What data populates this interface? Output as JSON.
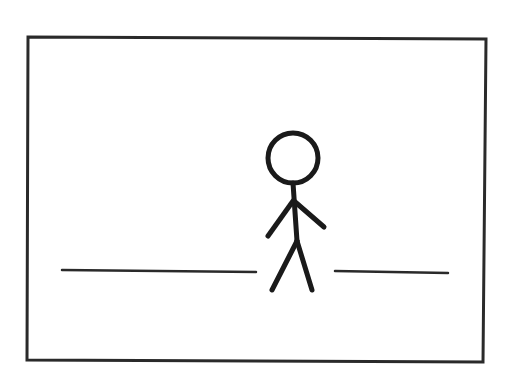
{
  "drawing": {
    "description": "Hand-drawn stick figure standing in a gap between two horizontal ground lines, inside a rectangular frame",
    "stroke_color": "#1a1a1a",
    "frame_color": "#2a2a2a",
    "background": "#ffffff",
    "frame": {
      "points": [
        [
          28,
          37
        ],
        [
          486,
          39
        ],
        [
          483,
          362
        ],
        [
          27,
          360
        ]
      ]
    },
    "ground_lines": [
      {
        "x1": 62,
        "y1": 270,
        "x2": 256,
        "y2": 272
      },
      {
        "x1": 335,
        "y1": 271,
        "x2": 448,
        "y2": 273
      }
    ],
    "figure": {
      "head": {
        "cx": 293,
        "cy": 158,
        "r": 25
      },
      "body": {
        "x1": 293,
        "y1": 183,
        "x2": 297,
        "y2": 241
      },
      "left_arm": {
        "x1": 293,
        "y1": 201,
        "x2": 268,
        "y2": 236
      },
      "right_arm": {
        "x1": 294,
        "y1": 201,
        "x2": 324,
        "y2": 227
      },
      "left_leg": {
        "x1": 297,
        "y1": 241,
        "x2": 272,
        "y2": 290
      },
      "right_leg": {
        "x1": 297,
        "y1": 241,
        "x2": 312,
        "y2": 290
      }
    }
  }
}
